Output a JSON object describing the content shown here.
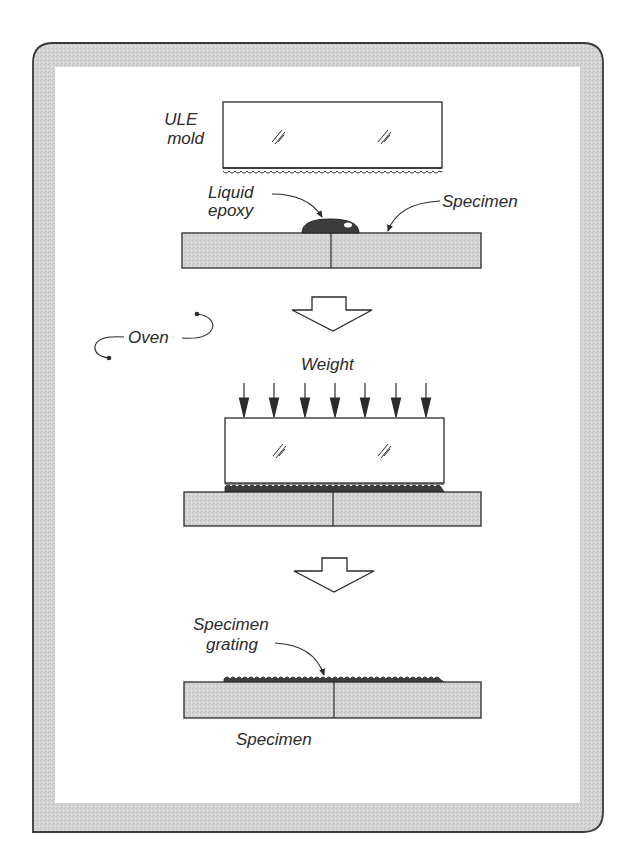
{
  "diagram": {
    "type": "process-flow",
    "colors": {
      "frame_fill": "#d4d4d4",
      "frame_stroke": "#3a3a3a",
      "panel_bg": "#ffffff",
      "specimen_fill": "#d9d9d9",
      "epoxy_fill": "#3c3c3c",
      "line": "#2a2a2a"
    },
    "steps": [
      {
        "id": "step-1",
        "labels": {
          "mold": [
            "ULE",
            "mold"
          ],
          "epoxy": [
            "Liquid",
            "epoxy"
          ],
          "specimen": "Specimen"
        }
      },
      {
        "id": "step-2",
        "labels": {
          "oven": "Oven",
          "weight": "Weight"
        },
        "weight_arrow_count": 7
      },
      {
        "id": "step-3",
        "labels": {
          "grating": [
            "Specimen",
            "grating"
          ],
          "specimen": "Specimen"
        }
      }
    ]
  }
}
